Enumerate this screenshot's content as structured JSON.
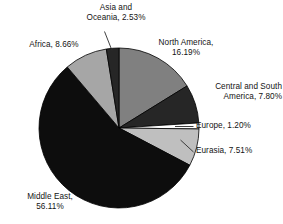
{
  "chart_data": {
    "type": "pie",
    "title": "",
    "subtitle": "",
    "xlabel": "",
    "ylabel": "",
    "legend_position": "none",
    "grid": false,
    "units": "percent",
    "start_angle_deg": 0,
    "direction": "clockwise",
    "categories": [
      "North America",
      "Central and South America",
      "Europe",
      "Eurasia",
      "Middle East",
      "Africa",
      "Asia and Oceania"
    ],
    "values": [
      16.19,
      7.8,
      1.2,
      7.51,
      56.11,
      8.66,
      2.53
    ],
    "colors": [
      "#808080",
      "#262626",
      "#ffffff",
      "#bfbfbf",
      "#0d0d0d",
      "#a6a6a6",
      "#262626"
    ],
    "slices": [
      {
        "label": "North America",
        "value": 16.19,
        "text": "North America,\n16.19%",
        "color": "#808080"
      },
      {
        "label": "Central and South America",
        "value": 7.8,
        "text": "Central and South\nAmerica, 7.80%",
        "color": "#262626"
      },
      {
        "label": "Europe",
        "value": 1.2,
        "text": "Europe, 1.20%",
        "color": "#ffffff"
      },
      {
        "label": "Eurasia",
        "value": 7.51,
        "text": "Eurasia, 7.51%",
        "color": "#bfbfbf"
      },
      {
        "label": "Middle East",
        "value": 56.11,
        "text": "Middle East,\n56.11%",
        "color": "#0d0d0d"
      },
      {
        "label": "Africa",
        "value": 8.66,
        "text": "Africa, 8.66%",
        "color": "#a6a6a6"
      },
      {
        "label": "Asia and Oceania",
        "value": 2.53,
        "text": "Asia and\nOceania, 2.53%",
        "color": "#262626"
      }
    ]
  },
  "labels": {
    "north_america": "North America,\n16.19%",
    "central_south_america": "Central and South\nAmerica, 7.80%",
    "europe": "Europe, 1.20%",
    "eurasia": "Eurasia, 7.51%",
    "middle_east": "Middle East,\n56.11%",
    "africa": "Africa, 8.66%",
    "asia_oceania": "Asia and\nOceania, 2.53%"
  },
  "style": {
    "background": "#ffffff",
    "text_color": "#131313",
    "outline_color": "#000000",
    "leader_line_color": "#2b2b2b"
  }
}
